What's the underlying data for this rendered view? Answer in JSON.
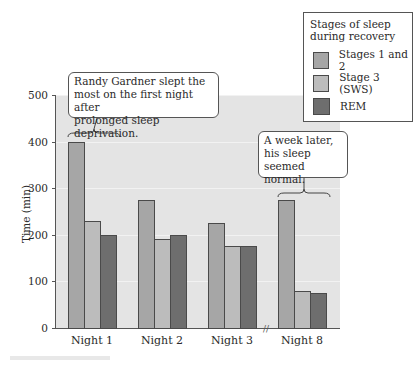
{
  "chart_data": {
    "type": "bar",
    "title": "",
    "xlabel": "",
    "ylabel": "Time (min)",
    "ylim": [
      0,
      500
    ],
    "yticks": [
      0,
      100,
      200,
      300,
      400,
      500
    ],
    "categories": [
      "Night 1",
      "Night 2",
      "Night 3",
      "Night 8"
    ],
    "series": [
      {
        "name": "Stages 1 and 2",
        "color": "#a6a6a6",
        "values": [
          400,
          275,
          225,
          275
        ]
      },
      {
        "name": "Stage 3 (SWS)",
        "color": "#bcbcbc",
        "values": [
          230,
          190,
          175,
          80
        ]
      },
      {
        "name": "REM",
        "color": "#6e6e6e",
        "values": [
          200,
          200,
          175,
          75
        ]
      }
    ],
    "legend": {
      "title": "Stages of sleep during recovery",
      "position": "top-right"
    },
    "annotations": [
      {
        "text": "Randy Gardner slept the most on the first night after prolonged sleep deprivation.",
        "target": "Night 1"
      },
      {
        "text": "A week later, his sleep seemed normal.",
        "target": "Night 8"
      }
    ],
    "grid": true,
    "axis_break_between": [
      "Night 3",
      "Night 8"
    ]
  },
  "axis": {
    "ylabel": "Time (min)",
    "yticks": [
      "0",
      "100",
      "200",
      "300",
      "400",
      "500"
    ],
    "xcats": [
      "Night 1",
      "Night 2",
      "Night 3",
      "Night 8"
    ]
  },
  "legend": {
    "title_line1": "Stages of sleep",
    "title_line2": "during recovery",
    "items": [
      "Stages 1 and 2",
      "Stage 3 (SWS)",
      "REM"
    ]
  },
  "annotations": {
    "a1": [
      "Randy Gardner slept the",
      "most on the first night after",
      "prolonged sleep deprivation."
    ],
    "a2": [
      "A week later,",
      "his sleep",
      "seemed normal."
    ]
  }
}
